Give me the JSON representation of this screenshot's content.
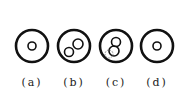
{
  "figure": {
    "stroke_color": "#111111",
    "panels": [
      {
        "id": "a",
        "label": "(a)",
        "center": [
          32,
          46
        ],
        "outer_radius": 16,
        "inner_circles": [
          {
            "cx": 32,
            "cy": 46,
            "r": 4,
            "style": "solid"
          }
        ]
      },
      {
        "id": "b",
        "label": "(b)",
        "center": [
          74,
          46
        ],
        "outer_radius": 16,
        "inner_circles": [
          {
            "cx": 78,
            "cy": 44,
            "r": 5,
            "style": "solid"
          },
          {
            "cx": 69,
            "cy": 52,
            "r": 4.5,
            "style": "solid"
          }
        ]
      },
      {
        "id": "c",
        "label": "(c)",
        "center": [
          116,
          46
        ],
        "outer_radius": 16,
        "inner_circles": [
          {
            "cx": 116,
            "cy": 42,
            "r": 4.5,
            "style": "solid"
          },
          {
            "cx": 114,
            "cy": 51,
            "r": 5,
            "style": "solid"
          },
          {
            "cx": 109,
            "cy": 54,
            "r": 4,
            "style": "dashed"
          }
        ]
      },
      {
        "id": "d",
        "label": "(d)",
        "center": [
          157,
          46
        ],
        "outer_radius": 16,
        "inner_circles": [
          {
            "cx": 157,
            "cy": 46,
            "r": 4,
            "style": "solid"
          }
        ]
      }
    ]
  },
  "labels": {
    "a": "(a)",
    "b": "(b)",
    "c": "(c)",
    "d": "(d)"
  }
}
